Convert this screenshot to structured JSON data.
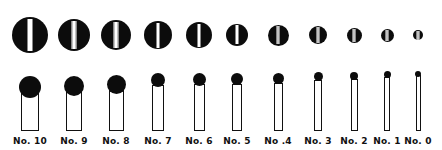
{
  "screws": [
    {
      "label": "No. 10",
      "cx": 30,
      "end_d": 36,
      "head_d": 22,
      "shaft_w": 18,
      "shaft_top": 91,
      "head_top": 76
    },
    {
      "label": "No. 9",
      "cx": 74,
      "end_d": 32,
      "head_d": 20,
      "shaft_w": 16,
      "shaft_top": 90,
      "head_top": 76
    },
    {
      "label": "No. 8",
      "cx": 116,
      "end_d": 30,
      "head_d": 19,
      "shaft_w": 15,
      "shaft_top": 88,
      "head_top": 75
    },
    {
      "label": "No. 7",
      "cx": 158,
      "end_d": 28,
      "head_d": 14,
      "shaft_w": 12,
      "shaft_top": 85,
      "head_top": 73
    },
    {
      "label": "No. 6",
      "cx": 199,
      "end_d": 26,
      "head_d": 13,
      "shaft_w": 11,
      "shaft_top": 84,
      "head_top": 73
    },
    {
      "label": "No. 5",
      "cx": 237,
      "end_d": 22,
      "head_d": 12,
      "shaft_w": 10,
      "shaft_top": 84,
      "head_top": 73
    },
    {
      "label": "No .4",
      "cx": 278,
      "end_d": 21,
      "head_d": 11,
      "shaft_w": 9,
      "shaft_top": 83,
      "head_top": 73
    },
    {
      "label": "No. 3",
      "cx": 318,
      "end_d": 18,
      "head_d": 9,
      "shaft_w": 8,
      "shaft_top": 80,
      "head_top": 72
    },
    {
      "label": "No. 2",
      "cx": 354,
      "end_d": 15,
      "head_d": 8,
      "shaft_w": 7,
      "shaft_top": 79,
      "head_top": 72
    },
    {
      "label": "No. 1",
      "cx": 387,
      "end_d": 13,
      "head_d": 7,
      "shaft_w": 6,
      "shaft_top": 77,
      "head_top": 71
    },
    {
      "label": "No. 0",
      "cx": 418,
      "end_d": 10,
      "head_d": 6,
      "shaft_w": 5,
      "shaft_top": 75,
      "head_top": 71
    }
  ],
  "layout": {
    "end_center_y": 35,
    "shaft_bottom": 131
  },
  "colors": {
    "ink": "#0c0c0c",
    "paper": "#ffffff"
  }
}
